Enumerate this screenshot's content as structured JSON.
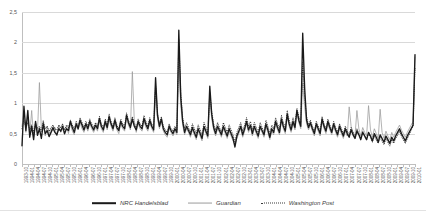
{
  "chart_data": {
    "type": "line",
    "title": "",
    "xlabel": "",
    "ylabel": "",
    "ylim": [
      0,
      2.5
    ],
    "grid": true,
    "legend_position": "bottom",
    "y_ticks": [
      "0",
      "0,5",
      "1",
      "1,5",
      "2",
      "2,5"
    ],
    "y_tick_values": [
      0,
      0.5,
      1,
      1.5,
      2,
      2.5
    ],
    "x_tick_labels": [
      "1993-10",
      "1994-01",
      "1994-04",
      "1994-07",
      "1994-10",
      "1995-01",
      "1995-04",
      "1995-07",
      "1995-10",
      "1996-01",
      "1996-04",
      "1996-07",
      "1996-10",
      "1997-01",
      "1997-04",
      "1997-07",
      "1997-10",
      "1998-01",
      "1998-04",
      "1998-07",
      "1998-10",
      "1999-01",
      "1999-04",
      "1999-07",
      "1999-10",
      "2000-01",
      "2000-04",
      "2000-07",
      "2000-10",
      "2001-01",
      "2001-04",
      "2001-07",
      "2001-10",
      "2002-01",
      "2002-04",
      "2002-07",
      "2002-10",
      "2003-01",
      "2003-04",
      "2003-07",
      "2003-10",
      "2004-01",
      "2004-04",
      "2004-07",
      "2004-10",
      "2005-01",
      "2005-04",
      "2005-07",
      "2005-10",
      "2006-01",
      "2006-04",
      "2006-07",
      "2006-10",
      "2007-01",
      "2007-04",
      "2007-07",
      "2007-10",
      "2008-01",
      "2008-04",
      "2008-07",
      "2008-10",
      "2009-01",
      "2009-04",
      "2009-07",
      "2009-10",
      "2010-01"
    ],
    "x_label_step": 3,
    "series": [
      {
        "name": "NRC Handelsblad",
        "color": "#1a1a1a",
        "style": "solid-thick",
        "values": [
          0.3,
          0.95,
          0.55,
          0.88,
          0.44,
          0.62,
          0.4,
          0.7,
          0.47,
          0.58,
          0.42,
          0.66,
          0.5,
          0.55,
          0.45,
          0.52,
          0.6,
          0.52,
          0.48,
          0.58,
          0.54,
          0.62,
          0.5,
          0.58,
          0.55,
          0.7,
          0.6,
          0.52,
          0.66,
          0.58,
          0.72,
          0.64,
          0.56,
          0.66,
          0.58,
          0.7,
          0.62,
          0.56,
          0.64,
          0.58,
          0.75,
          0.62,
          0.56,
          0.7,
          0.6,
          0.78,
          0.66,
          0.58,
          0.72,
          0.6,
          0.55,
          0.7,
          0.62,
          0.58,
          0.8,
          0.68,
          0.6,
          0.74,
          0.62,
          0.56,
          0.7,
          0.62,
          0.58,
          0.75,
          0.65,
          0.58,
          0.72,
          0.62,
          0.56,
          1.42,
          0.8,
          0.62,
          0.74,
          0.58,
          0.52,
          0.48,
          0.62,
          0.55,
          0.5,
          0.58,
          0.52,
          2.2,
          1.1,
          0.7,
          0.52,
          0.62,
          0.55,
          0.48,
          0.6,
          0.52,
          0.44,
          0.58,
          0.5,
          0.42,
          0.62,
          0.54,
          0.46,
          1.28,
          0.82,
          0.6,
          0.5,
          0.62,
          0.55,
          0.48,
          0.62,
          0.54,
          0.46,
          0.58,
          0.5,
          0.42,
          0.28,
          0.46,
          0.54,
          0.62,
          0.48,
          0.58,
          0.7,
          0.56,
          0.64,
          0.5,
          0.62,
          0.54,
          0.46,
          0.62,
          0.55,
          0.48,
          0.66,
          0.56,
          0.44,
          0.58,
          0.52,
          0.7,
          0.6,
          0.52,
          0.74,
          0.62,
          0.54,
          0.82,
          0.66,
          0.56,
          0.7,
          0.6,
          0.88,
          0.72,
          0.62,
          2.15,
          1.25,
          0.72,
          0.6,
          0.68,
          0.58,
          0.5,
          0.66,
          0.58,
          0.5,
          0.74,
          0.62,
          0.54,
          0.7,
          0.6,
          0.52,
          0.66,
          0.56,
          0.48,
          0.62,
          0.54,
          0.46,
          0.58,
          0.5,
          0.44,
          0.56,
          0.48,
          0.42,
          0.54,
          0.48,
          0.4,
          0.52,
          0.46,
          0.4,
          0.52,
          0.46,
          0.38,
          0.5,
          0.44,
          0.36,
          0.48,
          0.42,
          0.36,
          0.46,
          0.4,
          0.34,
          0.44,
          0.38,
          0.46,
          0.52,
          0.58,
          0.5,
          0.44,
          0.38,
          0.46,
          0.52,
          0.58,
          0.64,
          1.8
        ]
      },
      {
        "name": "Guardian",
        "color": "#9a9a9a",
        "style": "solid-thin",
        "values": [
          0.62,
          0.84,
          0.52,
          0.76,
          0.48,
          0.88,
          0.44,
          0.66,
          0.52,
          1.34,
          0.58,
          0.72,
          0.46,
          0.62,
          0.5,
          0.58,
          0.54,
          0.6,
          0.46,
          0.64,
          0.52,
          0.58,
          0.48,
          0.62,
          0.5,
          0.66,
          0.54,
          0.48,
          0.62,
          0.56,
          0.68,
          0.58,
          0.52,
          0.62,
          0.54,
          0.66,
          0.58,
          0.52,
          0.6,
          0.54,
          0.7,
          0.58,
          0.52,
          0.66,
          0.56,
          0.72,
          0.62,
          0.54,
          0.68,
          0.56,
          0.5,
          0.66,
          0.58,
          0.54,
          0.74,
          0.64,
          0.56,
          1.52,
          0.72,
          0.52,
          0.66,
          0.58,
          0.54,
          0.7,
          0.6,
          0.54,
          0.68,
          0.58,
          0.52,
          1.12,
          0.74,
          0.58,
          0.7,
          0.54,
          0.48,
          0.44,
          0.58,
          0.52,
          0.46,
          0.54,
          0.48,
          1.62,
          0.96,
          0.64,
          0.48,
          0.58,
          0.52,
          0.44,
          0.56,
          0.48,
          0.4,
          0.54,
          0.46,
          0.38,
          0.58,
          0.5,
          0.42,
          1.08,
          0.74,
          0.56,
          0.46,
          0.58,
          0.52,
          0.44,
          0.58,
          0.5,
          0.42,
          0.54,
          0.46,
          0.38,
          0.32,
          0.42,
          0.5,
          0.58,
          0.44,
          0.54,
          0.66,
          0.52,
          0.6,
          0.46,
          0.58,
          0.5,
          0.42,
          0.58,
          0.52,
          0.44,
          0.62,
          0.52,
          0.4,
          0.54,
          0.48,
          0.66,
          0.56,
          0.48,
          0.7,
          0.58,
          0.5,
          0.78,
          0.62,
          0.52,
          0.66,
          0.56,
          0.84,
          0.68,
          0.58,
          1.32,
          0.94,
          0.66,
          0.56,
          0.64,
          0.54,
          0.46,
          0.62,
          0.54,
          0.46,
          0.7,
          0.58,
          0.5,
          0.66,
          0.56,
          0.48,
          0.62,
          0.52,
          0.44,
          0.58,
          0.5,
          0.42,
          0.54,
          0.46,
          0.94,
          0.62,
          0.52,
          0.46,
          0.88,
          0.58,
          0.46,
          0.6,
          0.52,
          0.46,
          0.96,
          0.56,
          0.44,
          0.58,
          0.5,
          0.42,
          0.9,
          0.52,
          0.42,
          0.54,
          0.46,
          0.4,
          0.52,
          0.44,
          0.52,
          0.58,
          0.64,
          0.56,
          0.5,
          0.44,
          0.52,
          0.58,
          0.64,
          0.7,
          1.76
        ]
      },
      {
        "name": "Washington Post",
        "color": "#3a3a3a",
        "style": "dotted",
        "values": [
          0.58,
          0.72,
          0.6,
          0.68,
          0.56,
          0.64,
          0.52,
          0.68,
          0.58,
          0.62,
          0.54,
          0.7,
          0.58,
          0.62,
          0.54,
          0.6,
          0.64,
          0.58,
          0.56,
          0.64,
          0.6,
          0.66,
          0.56,
          0.64,
          0.6,
          0.72,
          0.64,
          0.58,
          0.7,
          0.62,
          0.76,
          0.68,
          0.6,
          0.7,
          0.62,
          0.74,
          0.66,
          0.6,
          0.68,
          0.62,
          0.78,
          0.66,
          0.6,
          0.74,
          0.64,
          0.82,
          0.7,
          0.62,
          0.76,
          0.64,
          0.58,
          0.74,
          0.66,
          0.62,
          0.84,
          0.72,
          0.64,
          0.78,
          0.66,
          0.6,
          0.74,
          0.66,
          0.62,
          0.8,
          0.7,
          0.62,
          0.76,
          0.66,
          0.6,
          1.3,
          0.84,
          0.66,
          0.78,
          0.62,
          0.56,
          0.52,
          0.66,
          0.58,
          0.54,
          0.62,
          0.56,
          2.05,
          1.18,
          0.76,
          0.58,
          0.68,
          0.6,
          0.52,
          0.66,
          0.58,
          0.5,
          0.64,
          0.56,
          0.48,
          0.68,
          0.6,
          0.52,
          1.18,
          0.86,
          0.66,
          0.56,
          0.68,
          0.6,
          0.52,
          0.68,
          0.6,
          0.52,
          0.64,
          0.56,
          0.48,
          0.36,
          0.52,
          0.6,
          0.68,
          0.54,
          0.64,
          0.76,
          0.62,
          0.7,
          0.56,
          0.68,
          0.6,
          0.52,
          0.68,
          0.6,
          0.52,
          0.72,
          0.62,
          0.5,
          0.64,
          0.58,
          0.76,
          0.66,
          0.58,
          0.8,
          0.68,
          0.6,
          0.88,
          0.72,
          0.62,
          0.76,
          0.66,
          0.92,
          0.78,
          0.68,
          1.68,
          1.1,
          0.78,
          0.64,
          0.72,
          0.62,
          0.54,
          0.7,
          0.62,
          0.54,
          0.78,
          0.66,
          0.58,
          0.74,
          0.64,
          0.56,
          0.7,
          0.6,
          0.52,
          0.66,
          0.58,
          0.5,
          0.62,
          0.54,
          0.48,
          0.6,
          0.52,
          0.44,
          0.58,
          0.5,
          0.42,
          0.54,
          0.46,
          0.4,
          0.5,
          0.44,
          0.36,
          0.46,
          0.4,
          0.34,
          0.44,
          0.38,
          0.32,
          0.42,
          0.36,
          0.3,
          0.4,
          0.34,
          0.42,
          0.48,
          0.54,
          0.46,
          0.4,
          0.34,
          0.42,
          0.48,
          0.56,
          0.62,
          1.58
        ]
      }
    ]
  },
  "legend": {
    "items": [
      {
        "label": "NRC Handelsblad",
        "swatch": "line-thick-black"
      },
      {
        "label": "Guardian",
        "swatch": "line-thin-gray"
      },
      {
        "label": "Washington Post",
        "swatch": "line-dotted-dark"
      }
    ]
  }
}
